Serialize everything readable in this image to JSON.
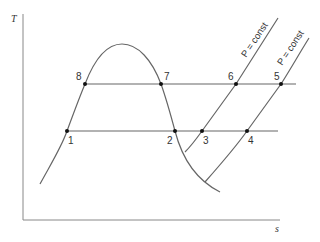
{
  "diagram": {
    "type": "T-s diagram",
    "axes": {
      "y_label": "T",
      "x_label": "s"
    },
    "isobar_labels": [
      {
        "id": "isobar-high",
        "text": "P = const"
      },
      {
        "id": "isobar-low",
        "text": "P = const"
      }
    ],
    "state_points": [
      {
        "id": "1",
        "label": "1"
      },
      {
        "id": "2",
        "label": "2"
      },
      {
        "id": "3",
        "label": "3"
      },
      {
        "id": "4",
        "label": "4"
      },
      {
        "id": "5",
        "label": "5"
      },
      {
        "id": "6",
        "label": "6"
      },
      {
        "id": "7",
        "label": "7"
      },
      {
        "id": "8",
        "label": "8"
      }
    ],
    "colors": {
      "line": "#666666",
      "point": "#111111",
      "text": "#333333"
    }
  }
}
